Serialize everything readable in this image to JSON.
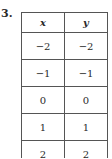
{
  "problem_number": "3.",
  "table": {
    "headers": [
      "x",
      "y"
    ],
    "rows": [
      [
        "−2",
        "−2"
      ],
      [
        "−1",
        "−1"
      ],
      [
        "0",
        "0"
      ],
      [
        "1",
        "1"
      ],
      [
        "2",
        "2"
      ]
    ]
  }
}
